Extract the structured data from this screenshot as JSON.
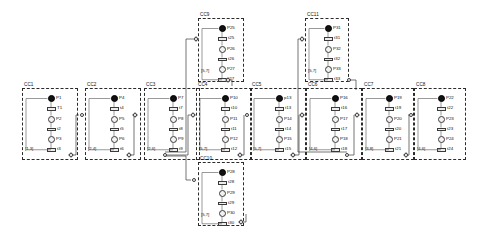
{
  "diagram": {
    "module_label_prefix": "CC",
    "colors": {
      "marked_place": "#111111",
      "place": "#f2f2f2",
      "transition": "#ededed",
      "border": "#2b2b2b"
    }
  },
  "modules": [
    {
      "id": "CC1",
      "label": "CC1",
      "x": 22,
      "y": 88,
      "w": 56,
      "h": 72,
      "guard": "[1,3]",
      "places": [
        {
          "name": "P1",
          "marked": true
        },
        {
          "name": "P2",
          "marked": false
        },
        {
          "name": "P3",
          "marked": false
        }
      ],
      "transitions": [
        {
          "name": "T1"
        },
        {
          "name": "t2"
        },
        {
          "name": "t3"
        }
      ]
    },
    {
      "id": "CC2",
      "label": "CC2",
      "x": 85,
      "y": 88,
      "w": 56,
      "h": 72,
      "guard": "[2,4]",
      "places": [
        {
          "name": "P4",
          "marked": true
        },
        {
          "name": "P5",
          "marked": false
        },
        {
          "name": "P6",
          "marked": false
        }
      ],
      "transitions": [
        {
          "name": "t4"
        },
        {
          "name": "t5"
        },
        {
          "name": "t6"
        }
      ]
    },
    {
      "id": "CC3",
      "label": "CC3",
      "x": 144,
      "y": 88,
      "w": 56,
      "h": 72,
      "guard": "[2,6]",
      "places": [
        {
          "name": "P7",
          "marked": true
        },
        {
          "name": "P8",
          "marked": false
        },
        {
          "name": "P9",
          "marked": false
        }
      ],
      "transitions": [
        {
          "name": "t7"
        },
        {
          "name": "t8"
        },
        {
          "name": "t9"
        }
      ]
    },
    {
      "id": "CC4",
      "label": "CC4",
      "x": 196,
      "y": 88,
      "w": 56,
      "h": 72,
      "guard": "[5,7]",
      "places": [
        {
          "name": "P10",
          "marked": true
        },
        {
          "name": "P11",
          "marked": false
        },
        {
          "name": "P12",
          "marked": false
        }
      ],
      "transitions": [
        {
          "name": "t10"
        },
        {
          "name": "t11"
        },
        {
          "name": "t12"
        }
      ]
    },
    {
      "id": "CC5",
      "label": "CC5",
      "x": 250,
      "y": 88,
      "w": 56,
      "h": 72,
      "guard": "[5,7]",
      "places": [
        {
          "name": "p13",
          "marked": true
        },
        {
          "name": "P14",
          "marked": false
        },
        {
          "name": "P15",
          "marked": false
        }
      ],
      "transitions": [
        {
          "name": "t13"
        },
        {
          "name": "t14"
        },
        {
          "name": "t15"
        }
      ]
    },
    {
      "id": "CC6",
      "label": "CC6",
      "x": 306,
      "y": 88,
      "w": 56,
      "h": 72,
      "guard": "[4,6]",
      "places": [
        {
          "name": "P16",
          "marked": true
        },
        {
          "name": "P17",
          "marked": false
        },
        {
          "name": "P18",
          "marked": false
        }
      ],
      "transitions": [
        {
          "name": "t16"
        },
        {
          "name": "t17"
        },
        {
          "name": "t18"
        }
      ]
    },
    {
      "id": "CC7",
      "label": "CC7",
      "x": 362,
      "y": 88,
      "w": 52,
      "h": 72,
      "guard": "[3,8]",
      "places": [
        {
          "name": "P19",
          "marked": true
        },
        {
          "name": "P20",
          "marked": false
        },
        {
          "name": "P21",
          "marked": false
        }
      ],
      "transitions": [
        {
          "name": "t19"
        },
        {
          "name": "t20"
        },
        {
          "name": "t21"
        }
      ]
    },
    {
      "id": "CC8",
      "label": "CC8",
      "x": 414,
      "y": 88,
      "w": 52,
      "h": 72,
      "guard": "[4,6]",
      "places": [
        {
          "name": "P22",
          "marked": true
        },
        {
          "name": "P23",
          "marked": false
        },
        {
          "name": "P24",
          "marked": false
        }
      ],
      "transitions": [
        {
          "name": "t22"
        },
        {
          "name": "t23"
        },
        {
          "name": "t24"
        }
      ]
    },
    {
      "id": "CC9",
      "label": "CC9",
      "x": 198,
      "y": 18,
      "w": 46,
      "h": 64,
      "guard": "[5,7]",
      "places": [
        {
          "name": "P25",
          "marked": true
        },
        {
          "name": "P26",
          "marked": false
        },
        {
          "name": "P27",
          "marked": false
        }
      ],
      "transitions": [
        {
          "name": "t25"
        },
        {
          "name": "t26"
        },
        {
          "name": "t27"
        }
      ]
    },
    {
      "id": "CC10",
      "label": "CC10",
      "x": 198,
      "y": 162,
      "w": 46,
      "h": 64,
      "guard": "[5,7]",
      "places": [
        {
          "name": "P28",
          "marked": true
        },
        {
          "name": "P29",
          "marked": false
        },
        {
          "name": "P30",
          "marked": false
        }
      ],
      "transitions": [
        {
          "name": "t28"
        },
        {
          "name": "t29"
        },
        {
          "name": "t30"
        }
      ]
    },
    {
      "id": "CC11",
      "label": "CC11",
      "x": 305,
      "y": 18,
      "w": 44,
      "h": 64,
      "guard": "[5,7]",
      "places": [
        {
          "name": "P31",
          "marked": true
        },
        {
          "name": "P32",
          "marked": false
        },
        {
          "name": "P33",
          "marked": false
        }
      ],
      "transitions": [
        {
          "name": "t31"
        },
        {
          "name": "t32"
        },
        {
          "name": "t33"
        }
      ]
    }
  ],
  "ports": [
    {
      "name": "port-cc1-out",
      "x": 69,
      "y": 153
    },
    {
      "name": "port-cc2-in",
      "x": 80,
      "y": 113
    },
    {
      "name": "port-cc2-out",
      "x": 127,
      "y": 153
    },
    {
      "name": "port-cc3-in",
      "x": 133,
      "y": 113
    },
    {
      "name": "port-cc3-out",
      "x": 163,
      "y": 153
    },
    {
      "name": "port-cc4-in",
      "x": 191,
      "y": 113
    },
    {
      "name": "port-cc4-out",
      "x": 238,
      "y": 153
    },
    {
      "name": "port-cc5-in",
      "x": 245,
      "y": 113
    },
    {
      "name": "port-cc5-out",
      "x": 291,
      "y": 153
    },
    {
      "name": "port-cc6-in",
      "x": 300,
      "y": 113
    },
    {
      "name": "port-cc6-out",
      "x": 345,
      "y": 153
    },
    {
      "name": "port-cc7-in",
      "x": 355,
      "y": 113
    },
    {
      "name": "port-cc7-out",
      "x": 404,
      "y": 153
    },
    {
      "name": "port-cc8-in",
      "x": 409,
      "y": 113
    },
    {
      "name": "port-cc9-in",
      "x": 194,
      "y": 37
    },
    {
      "name": "port-cc9-out",
      "x": 226,
      "y": 78
    },
    {
      "name": "port-cc10-in",
      "x": 192,
      "y": 178
    },
    {
      "name": "port-cc10-out",
      "x": 239,
      "y": 220
    },
    {
      "name": "port-cc11-in",
      "x": 300,
      "y": 37
    },
    {
      "name": "port-cc11-out",
      "x": 347,
      "y": 78
    }
  ]
}
